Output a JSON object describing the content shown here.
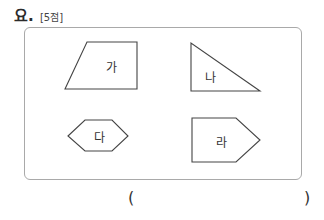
{
  "question": {
    "header_text": "요.",
    "score": "[5점]"
  },
  "figures": [
    {
      "label": "가",
      "shape": "trapezoid"
    },
    {
      "label": "나",
      "shape": "right-triangle"
    },
    {
      "label": "다",
      "shape": "hexagon"
    },
    {
      "label": "라",
      "shape": "pentagon"
    }
  ],
  "answer": {
    "open_paren": "(",
    "close_paren": ")",
    "value": ""
  }
}
